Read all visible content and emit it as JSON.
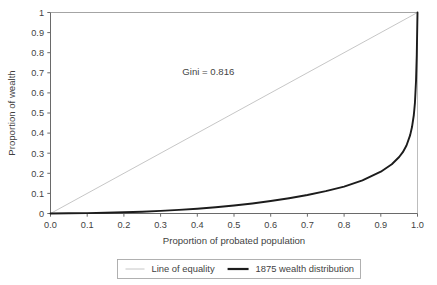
{
  "chart_data": {
    "type": "line",
    "title": "",
    "xlabel": "Proportion of probated population",
    "ylabel": "Proportion of wealth",
    "xlim": [
      0,
      1
    ],
    "ylim": [
      0,
      1
    ],
    "grid": false,
    "legend_position": "bottom",
    "xticks": [
      "0.0",
      "0.1",
      "0.2",
      "0.3",
      "0.4",
      "0.5",
      "0.6",
      "0.7",
      "0.8",
      "0.9",
      "1.0"
    ],
    "xtick_values": [
      0,
      0.1,
      0.2,
      0.3,
      0.4,
      0.5,
      0.6,
      0.7,
      0.8,
      0.9,
      1
    ],
    "yticks": [
      "0",
      "0.1",
      "0.2",
      "0.3",
      "0.4",
      "0.5",
      "0.6",
      "0.7",
      "0.8",
      "0.9",
      "1"
    ],
    "ytick_values": [
      0,
      0.1,
      0.2,
      0.3,
      0.4,
      0.5,
      0.6,
      0.7,
      0.8,
      0.9,
      1
    ],
    "annotations": [
      {
        "text": "Gini = 0.816",
        "x": 0.43,
        "y": 0.69
      }
    ],
    "series": [
      {
        "name": "Line of equality",
        "color": "#bfbfbf",
        "width": 0.9,
        "x": [
          0,
          1
        ],
        "values": [
          0,
          1
        ]
      },
      {
        "name": "1875 wealth distribution",
        "color": "#1c1c1c",
        "width": 1.9,
        "x": [
          0,
          0.05,
          0.1,
          0.15,
          0.2,
          0.25,
          0.3,
          0.35,
          0.4,
          0.45,
          0.5,
          0.55,
          0.6,
          0.65,
          0.7,
          0.75,
          0.8,
          0.85,
          0.9,
          0.93,
          0.95,
          0.96,
          0.97,
          0.98,
          0.985,
          0.99,
          0.993,
          0.996,
          0.998,
          1
        ],
        "values": [
          0,
          0.001,
          0.002,
          0.004,
          0.006,
          0.009,
          0.013,
          0.018,
          0.024,
          0.031,
          0.04,
          0.05,
          0.062,
          0.076,
          0.092,
          0.111,
          0.134,
          0.165,
          0.208,
          0.245,
          0.281,
          0.305,
          0.338,
          0.39,
          0.43,
          0.49,
          0.55,
          0.66,
          0.79,
          1
        ]
      }
    ]
  },
  "legend": {
    "items": [
      {
        "label": "Line of equality",
        "color": "#bfbfbf",
        "width": 0.9
      },
      {
        "label": "1875 wealth distribution",
        "color": "#1c1c1c",
        "width": 2.2
      }
    ]
  }
}
